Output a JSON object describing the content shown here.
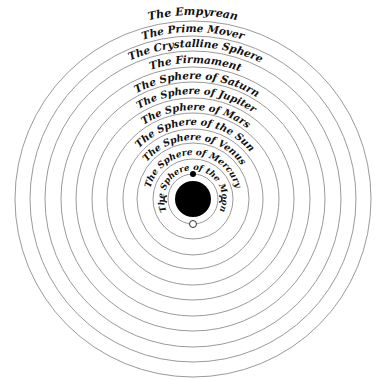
{
  "diagram": {
    "center": {
      "x": 193,
      "y": 199
    },
    "colors": {
      "ring": "#9a9a9a",
      "text": "#111111",
      "earth": "#000000",
      "background": "#ffffff"
    },
    "earth": {
      "radius": 18
    },
    "moon_orbit": {
      "radius": 25
    },
    "spheres": [
      {
        "label": "The Empyrean",
        "ring_radius": 178,
        "text_radius": 184,
        "font_size": 11,
        "start_deg": 224,
        "end_deg": 316
      },
      {
        "label": "The Prime Mover",
        "ring_radius": 163,
        "text_radius": 167,
        "font_size": 10.5,
        "start_deg": 222,
        "end_deg": 318
      },
      {
        "label": "The Crystalline Sphere",
        "ring_radius": 148,
        "text_radius": 152,
        "font_size": 10.5,
        "start_deg": 210,
        "end_deg": 332
      },
      {
        "label": "The Firmament",
        "ring_radius": 132,
        "text_radius": 136,
        "font_size": 10.5,
        "start_deg": 222,
        "end_deg": 320
      },
      {
        "label": "The Sphere of Saturn",
        "ring_radius": 117,
        "text_radius": 120,
        "font_size": 10.5,
        "start_deg": 206,
        "end_deg": 338
      },
      {
        "label": "The Sphere of Jupiter",
        "ring_radius": 101,
        "text_radius": 105,
        "font_size": 10,
        "start_deg": 204,
        "end_deg": 340
      },
      {
        "label": "The Sphere of Mars",
        "ring_radius": 86,
        "text_radius": 89,
        "font_size": 10,
        "start_deg": 204,
        "end_deg": 340
      },
      {
        "label": "The Sphere of the Sun",
        "ring_radius": 70,
        "text_radius": 74,
        "font_size": 10,
        "start_deg": 192,
        "end_deg": 352
      },
      {
        "label": "The Sphere of Venus",
        "ring_radius": 56,
        "text_radius": 59,
        "font_size": 9.5,
        "start_deg": 186,
        "end_deg": 358
      },
      {
        "label": "The Sphere of Mercury",
        "ring_radius": 40,
        "text_radius": 44,
        "font_size": 9,
        "start_deg": 160,
        "end_deg": 380
      },
      {
        "label": "The Sphere of the Moon",
        "ring_radius": 25,
        "text_radius": 29,
        "font_size": 8.5,
        "start_deg": 150,
        "end_deg": 390
      }
    ],
    "markers": {
      "sun_dot": {
        "angle_deg": 270,
        "radius": 3
      },
      "moon_circle": {
        "angle_deg": 90,
        "radius": 3.5
      }
    }
  }
}
